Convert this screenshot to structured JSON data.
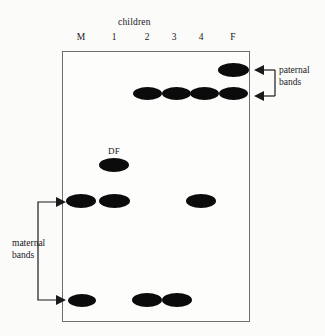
{
  "figure": {
    "type": "dna-fingerprint-gel",
    "title_above_lanes": "children",
    "lane_labels": [
      "M",
      "1",
      "2",
      "3",
      "4",
      "F"
    ],
    "lane_positions_px": [
      81,
      114,
      147,
      173,
      200,
      233
    ],
    "inline_label": "DF",
    "annotations": {
      "left": {
        "text_line1": "maternal",
        "text_line2": "bands",
        "arrow_targets": [
          "maternal-band-upper",
          "maternal-band-lower"
        ]
      },
      "right": {
        "text_line1": "paternal",
        "text_line2": "bands",
        "arrow_targets": [
          "paternal-band-upper",
          "paternal-band-lower"
        ]
      }
    },
    "colors": {
      "band": "#0b0b0b",
      "gel_border": "#6e6e73",
      "background": "#fbfbfa",
      "text": "#17171a"
    },
    "rows": [
      {
        "id": "paternal-band-upper",
        "y": 70,
        "lanes": [
          "F"
        ]
      },
      {
        "id": "paternal-band-lower",
        "y": 93,
        "lanes": [
          "2",
          "3",
          "4",
          "F"
        ]
      },
      {
        "id": "df-row",
        "y": 165,
        "lanes": [
          "1"
        ]
      },
      {
        "id": "maternal-band-upper",
        "y": 201,
        "lanes": [
          "M",
          "1",
          "4"
        ]
      },
      {
        "id": "maternal-band-lower",
        "y": 300,
        "lanes": [
          "M",
          "2",
          "3"
        ]
      }
    ],
    "bands": [
      {
        "name": "band-F-r1",
        "lane": "F",
        "row": "paternal-band-upper",
        "x": 233,
        "y": 70,
        "w": 31,
        "h": 14
      },
      {
        "name": "band-2-r2",
        "lane": "2",
        "row": "paternal-band-lower",
        "x": 147,
        "y": 93,
        "w": 29,
        "h": 13
      },
      {
        "name": "band-3-r2",
        "lane": "3",
        "row": "paternal-band-lower",
        "x": 176,
        "y": 93,
        "w": 29,
        "h": 13
      },
      {
        "name": "band-4-r2",
        "lane": "4",
        "row": "paternal-band-lower",
        "x": 204,
        "y": 93,
        "w": 29,
        "h": 13
      },
      {
        "name": "band-F-r2",
        "lane": "F",
        "row": "paternal-band-lower",
        "x": 233,
        "y": 93,
        "w": 29,
        "h": 13
      },
      {
        "name": "band-1-df",
        "lane": "1",
        "row": "df-row",
        "x": 114,
        "y": 165,
        "w": 30,
        "h": 14
      },
      {
        "name": "band-M-r4",
        "lane": "M",
        "row": "maternal-band-upper",
        "x": 81,
        "y": 201,
        "w": 30,
        "h": 14
      },
      {
        "name": "band-1-r4",
        "lane": "1",
        "row": "maternal-band-upper",
        "x": 114,
        "y": 201,
        "w": 31,
        "h": 14
      },
      {
        "name": "band-4-r4",
        "lane": "4",
        "row": "maternal-band-upper",
        "x": 201,
        "y": 201,
        "w": 30,
        "h": 14
      },
      {
        "name": "band-M-r5",
        "lane": "M",
        "row": "maternal-band-lower",
        "x": 82,
        "y": 300,
        "w": 28,
        "h": 13
      },
      {
        "name": "band-2-r5",
        "lane": "2",
        "row": "maternal-band-lower",
        "x": 147,
        "y": 300,
        "w": 30,
        "h": 14
      },
      {
        "name": "band-3-r5",
        "lane": "3",
        "row": "maternal-band-lower",
        "x": 177,
        "y": 300,
        "w": 30,
        "h": 14
      }
    ]
  }
}
